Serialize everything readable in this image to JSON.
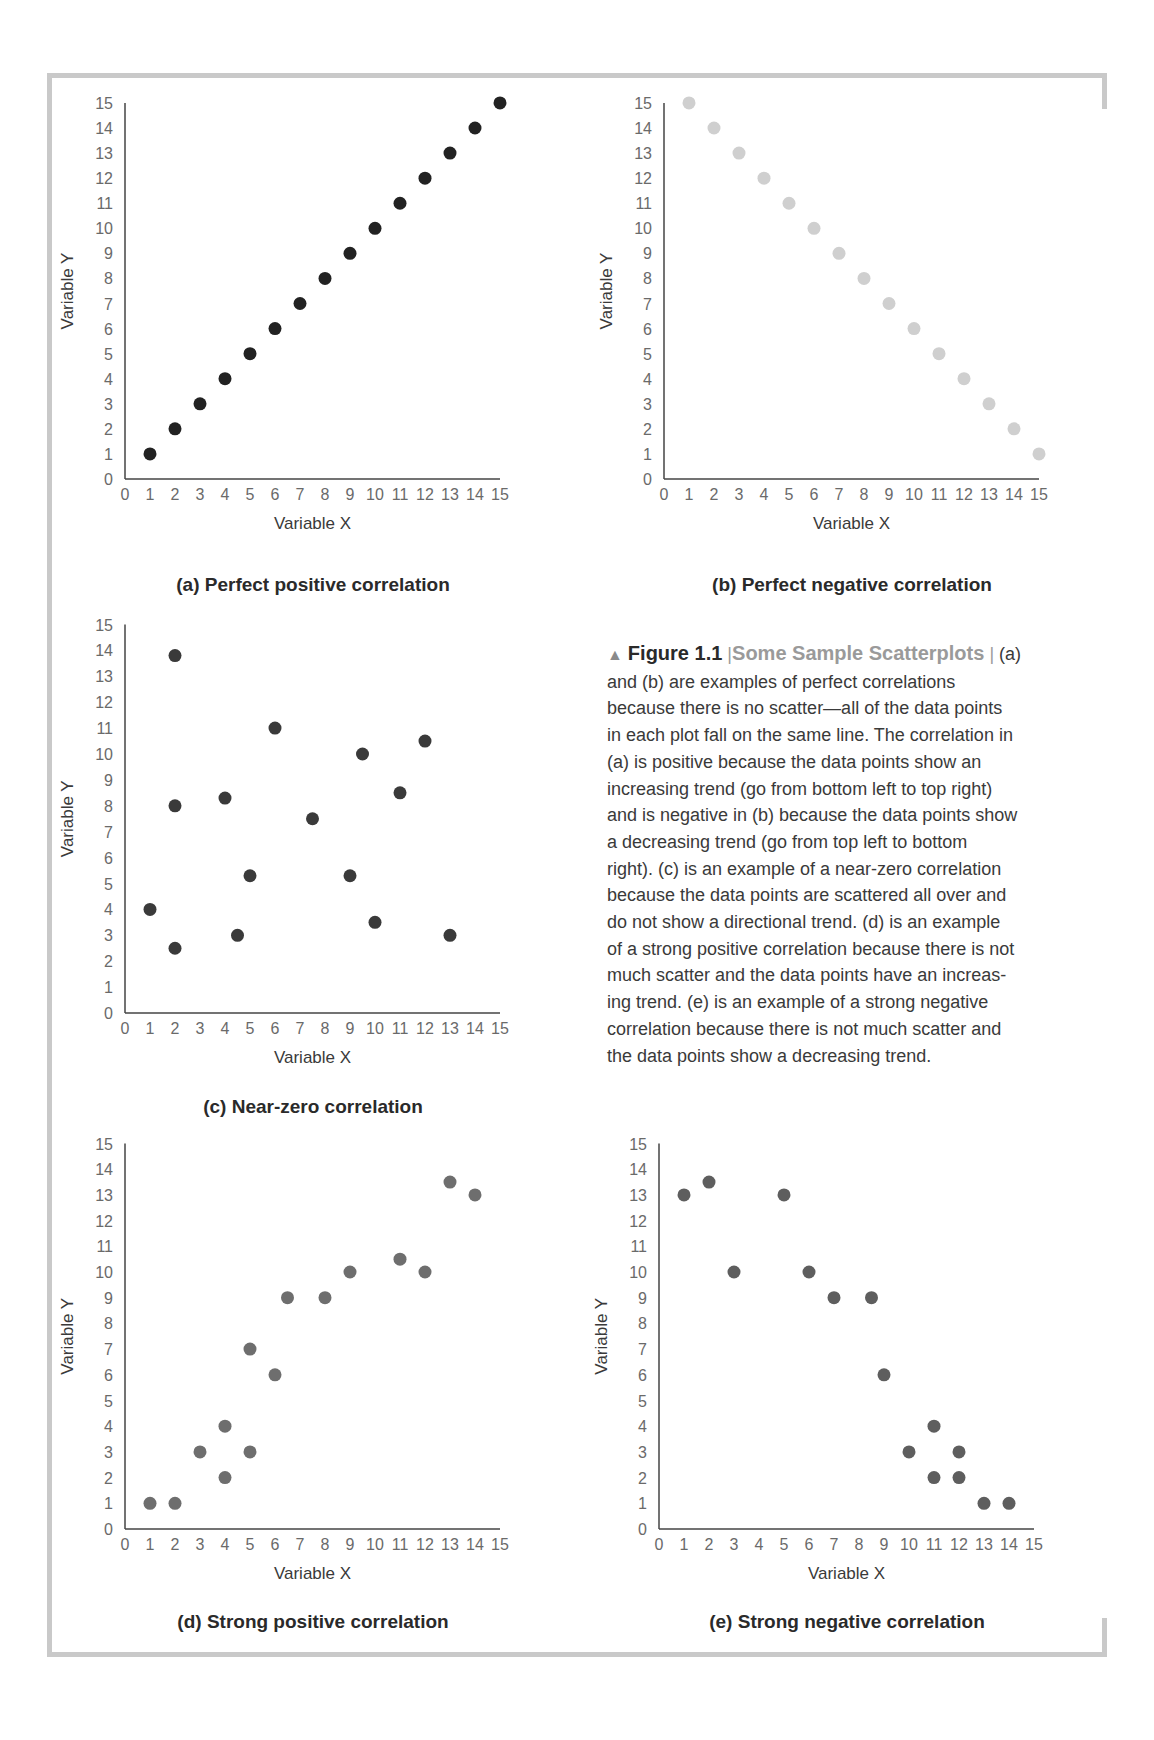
{
  "figure": {
    "marker": "▲",
    "label": "Figure 1.1",
    "separator": "|",
    "title": "Some Sample Scatterplots",
    "separator2": "|",
    "caption": "(a) and (b) are examples of perfect correlations because there is no scatter—all of the data points in each plot fall on the same line. The correlation in (a) is positive because the data points show an increasing trend (go from bottom left to top right) and is negative in (b) because the data points show a decreasing trend (go from top left to bottom right). (c) is an example of a near-zero correlation because the data points are scattered all over and do not show a directional trend. (d) is an example of a strong positive correlation because there is not much scatter and the data points have an increasing trend. (e) is an example of a strong negative correlation because there is not much scatter and the data points show a decreasing trend.",
    "caption_lines": [
      " (a)",
      "and (b) are examples of perfect correlations",
      "because there is no scatter—all of the data points",
      "in each plot fall on the same line. The correlation in",
      "(a) is positive because the data points show an",
      "increasing trend (go from bottom left to top right)",
      "and is negative in (b) because the data points show",
      "a decreasing trend (go from top left to bottom",
      "right). (c) is an example of a near-zero correlation",
      "because the data points are scattered all over and",
      "do not show a directional trend. (d) is an example",
      "of a strong positive correlation because there is not",
      "much scatter and the data points have an increas-",
      "ing trend. (e) is an example of a strong negative",
      "correlation because there is not much scatter and",
      "the data points show a decreasing trend."
    ]
  },
  "chart_data": [
    {
      "id": "a",
      "type": "scatter",
      "title": "(a) Perfect positive correlation",
      "xlabel": "Variable X",
      "ylabel": "Variable Y",
      "xlim": [
        0,
        15
      ],
      "ylim": [
        0,
        15
      ],
      "xticks": [
        0,
        1,
        2,
        3,
        4,
        5,
        6,
        7,
        8,
        9,
        10,
        11,
        12,
        13,
        14,
        15
      ],
      "yticks": [
        0,
        1,
        2,
        3,
        4,
        5,
        6,
        7,
        8,
        9,
        10,
        11,
        12,
        13,
        14,
        15
      ],
      "grid": false,
      "color": "#222222",
      "points": [
        [
          1,
          1
        ],
        [
          2,
          2
        ],
        [
          3,
          3
        ],
        [
          4,
          4
        ],
        [
          5,
          5
        ],
        [
          6,
          6
        ],
        [
          7,
          7
        ],
        [
          8,
          8
        ],
        [
          9,
          9
        ],
        [
          10,
          10
        ],
        [
          11,
          11
        ],
        [
          12,
          12
        ],
        [
          13,
          13
        ],
        [
          14,
          14
        ],
        [
          15,
          15
        ]
      ]
    },
    {
      "id": "b",
      "type": "scatter",
      "title": "(b) Perfect negative correlation",
      "xlabel": "Variable X",
      "ylabel": "Variable Y",
      "xlim": [
        0,
        15
      ],
      "ylim": [
        0,
        15
      ],
      "xticks": [
        0,
        1,
        2,
        3,
        4,
        5,
        6,
        7,
        8,
        9,
        10,
        11,
        12,
        13,
        14,
        15
      ],
      "yticks": [
        0,
        1,
        2,
        3,
        4,
        5,
        6,
        7,
        8,
        9,
        10,
        11,
        12,
        13,
        14,
        15
      ],
      "grid": false,
      "color": "#cfcfcf",
      "points": [
        [
          1,
          15
        ],
        [
          2,
          14
        ],
        [
          3,
          13
        ],
        [
          4,
          12
        ],
        [
          5,
          11
        ],
        [
          6,
          10
        ],
        [
          7,
          9
        ],
        [
          8,
          8
        ],
        [
          9,
          7
        ],
        [
          10,
          6
        ],
        [
          11,
          5
        ],
        [
          12,
          4
        ],
        [
          13,
          3
        ],
        [
          14,
          2
        ],
        [
          15,
          1
        ]
      ]
    },
    {
      "id": "c",
      "type": "scatter",
      "title": "(c) Near-zero correlation",
      "xlabel": "Variable X",
      "ylabel": "Variable Y",
      "xlim": [
        0,
        15
      ],
      "ylim": [
        0,
        15
      ],
      "xticks": [
        0,
        1,
        2,
        3,
        4,
        5,
        6,
        7,
        8,
        9,
        10,
        11,
        12,
        13,
        14,
        15
      ],
      "yticks": [
        0,
        1,
        2,
        3,
        4,
        5,
        6,
        7,
        8,
        9,
        10,
        11,
        12,
        13,
        14,
        15
      ],
      "grid": false,
      "color": "#3a3a3a",
      "points": [
        [
          1,
          4
        ],
        [
          2,
          13.8
        ],
        [
          2,
          8
        ],
        [
          2,
          2.5
        ],
        [
          4,
          8.3
        ],
        [
          4.5,
          3
        ],
        [
          5,
          5.3
        ],
        [
          6,
          11
        ],
        [
          7.5,
          7.5
        ],
        [
          9,
          5.3
        ],
        [
          9.5,
          10
        ],
        [
          10,
          3.5
        ],
        [
          11,
          8.5
        ],
        [
          12,
          10.5
        ],
        [
          13,
          3
        ]
      ]
    },
    {
      "id": "d",
      "type": "scatter",
      "title": "(d) Strong positive correlation",
      "xlabel": "Variable X",
      "ylabel": "Variable Y",
      "xlim": [
        0,
        15
      ],
      "ylim": [
        0,
        15
      ],
      "xticks": [
        0,
        1,
        2,
        3,
        4,
        5,
        6,
        7,
        8,
        9,
        10,
        11,
        12,
        13,
        14,
        15
      ],
      "yticks": [
        0,
        1,
        2,
        3,
        4,
        5,
        6,
        7,
        8,
        9,
        10,
        11,
        12,
        13,
        14,
        15
      ],
      "grid": false,
      "color": "#6e6e6e",
      "points": [
        [
          1,
          1
        ],
        [
          2,
          1
        ],
        [
          3,
          3
        ],
        [
          4,
          4
        ],
        [
          4,
          2
        ],
        [
          5,
          7
        ],
        [
          5,
          3
        ],
        [
          6,
          6
        ],
        [
          6.5,
          9
        ],
        [
          8,
          9
        ],
        [
          9,
          10
        ],
        [
          11,
          10.5
        ],
        [
          12,
          10
        ],
        [
          13,
          13.5
        ],
        [
          14,
          13
        ]
      ]
    },
    {
      "id": "e",
      "type": "scatter",
      "title": "(e) Strong negative correlation",
      "xlabel": "Variable X",
      "ylabel": "Variable Y",
      "xlim": [
        0,
        15
      ],
      "ylim": [
        0,
        15
      ],
      "xticks": [
        0,
        1,
        2,
        3,
        4,
        5,
        6,
        7,
        8,
        9,
        10,
        11,
        12,
        13,
        14,
        15
      ],
      "yticks": [
        0,
        1,
        2,
        3,
        4,
        5,
        6,
        7,
        8,
        9,
        10,
        11,
        12,
        13,
        14,
        15
      ],
      "grid": false,
      "color": "#5e5e5e",
      "points": [
        [
          1,
          13
        ],
        [
          2,
          13.5
        ],
        [
          3,
          10
        ],
        [
          5,
          13
        ],
        [
          6,
          10
        ],
        [
          7,
          9
        ],
        [
          8.5,
          9
        ],
        [
          9,
          6
        ],
        [
          10,
          3
        ],
        [
          11,
          4
        ],
        [
          11,
          2
        ],
        [
          12,
          3
        ],
        [
          12,
          2
        ],
        [
          13,
          1
        ],
        [
          14,
          1
        ]
      ]
    }
  ]
}
